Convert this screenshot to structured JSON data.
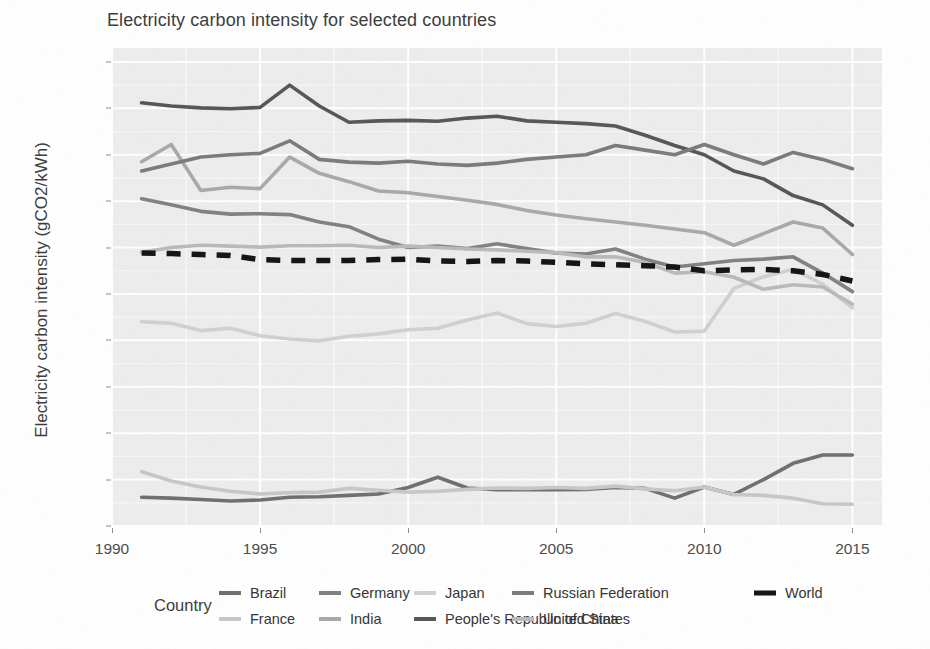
{
  "chart_data": {
    "type": "line",
    "title": "Electricity carbon intensity for selected countries",
    "xlabel": "",
    "ylabel": "Electricity carbon intensity (gCO2/kWh)",
    "legend_title": "Country",
    "legend_position": "bottom",
    "grid": true,
    "xlim": [
      1990,
      2016
    ],
    "ylim": [
      0,
      1030
    ],
    "x_ticks": [
      1990,
      1995,
      2000,
      2005,
      2010,
      2015
    ],
    "y_ticks": [
      0,
      100,
      200,
      300,
      400,
      500,
      600,
      700,
      800,
      900,
      1000
    ],
    "x": [
      1991,
      1992,
      1993,
      1994,
      1995,
      1996,
      1997,
      1998,
      1999,
      2000,
      2001,
      2002,
      2003,
      2004,
      2005,
      2006,
      2007,
      2008,
      2009,
      2010,
      2011,
      2012,
      2013,
      2014,
      2015
    ],
    "series": [
      {
        "name": "Brazil",
        "color": "#6e6e6e",
        "style": "solid",
        "values": [
          62,
          60,
          57,
          54,
          56,
          62,
          63,
          66,
          69,
          83,
          105,
          82,
          78,
          79,
          78,
          79,
          83,
          81,
          60,
          84,
          68,
          100,
          135,
          153,
          153
        ]
      },
      {
        "name": "France",
        "color": "#c7c7c7",
        "style": "solid",
        "values": [
          117,
          97,
          84,
          75,
          69,
          72,
          73,
          81,
          77,
          73,
          75,
          79,
          82,
          81,
          83,
          81,
          86,
          80,
          76,
          84,
          68,
          66,
          60,
          48,
          47
        ]
      },
      {
        "name": "Germany",
        "color": "#808080",
        "style": "solid",
        "values": [
          705,
          692,
          678,
          672,
          673,
          671,
          655,
          645,
          618,
          600,
          603,
          598,
          608,
          598,
          588,
          586,
          597,
          575,
          558,
          565,
          572,
          575,
          580,
          545,
          505
        ]
      },
      {
        "name": "India",
        "color": "#a8a8a8",
        "style": "solid",
        "values": [
          785,
          822,
          723,
          730,
          727,
          795,
          760,
          742,
          722,
          718,
          710,
          702,
          693,
          680,
          670,
          662,
          655,
          648,
          640,
          632,
          605,
          630,
          655,
          642,
          585
        ]
      },
      {
        "name": "Japan",
        "color": "#d0d0d0",
        "style": "solid",
        "values": [
          440,
          437,
          421,
          426,
          410,
          403,
          399,
          409,
          414,
          423,
          426,
          444,
          459,
          436,
          430,
          437,
          458,
          441,
          418,
          420,
          512,
          537,
          553,
          521,
          470
        ]
      },
      {
        "name": "People's Republic of China",
        "color": "#555555",
        "style": "solid",
        "values": [
          912,
          905,
          901,
          899,
          902,
          950,
          905,
          870,
          873,
          874,
          872,
          879,
          883,
          873,
          870,
          867,
          862,
          842,
          820,
          800,
          765,
          748,
          712,
          692,
          648
        ]
      },
      {
        "name": "Russian Federation",
        "color": "#7a7a7a",
        "style": "solid",
        "values": [
          765,
          780,
          795,
          800,
          803,
          830,
          790,
          784,
          782,
          786,
          780,
          777,
          782,
          790,
          795,
          800,
          820,
          810,
          800,
          822,
          800,
          780,
          805,
          790,
          770
        ]
      },
      {
        "name": "United States",
        "color": "#b9b9b9",
        "style": "solid",
        "values": [
          590,
          600,
          605,
          603,
          601,
          604,
          604,
          605,
          600,
          603,
          600,
          597,
          595,
          592,
          589,
          580,
          580,
          568,
          545,
          548,
          536,
          510,
          520,
          515,
          478
        ]
      },
      {
        "name": "World",
        "color": "#111111",
        "style": "dashed",
        "values": [
          588,
          587,
          585,
          583,
          574,
          572,
          572,
          572,
          574,
          575,
          571,
          570,
          572,
          571,
          568,
          565,
          563,
          561,
          558,
          550,
          552,
          553,
          550,
          542,
          528
        ]
      }
    ]
  },
  "legend": {
    "title": "Country",
    "entries": [
      {
        "label": "Brazil"
      },
      {
        "label": "France"
      },
      {
        "label": "Germany"
      },
      {
        "label": "India"
      },
      {
        "label": "Japan"
      },
      {
        "label": "People's Republic of China"
      },
      {
        "label": "Russian Federation"
      },
      {
        "label": "United States"
      },
      {
        "label": "World"
      }
    ]
  },
  "colors": {
    "panel_background": "#ededed",
    "grid_major": "#ffffff",
    "grid_minor": "#f7f7f7",
    "text": "#3a3a3a"
  }
}
